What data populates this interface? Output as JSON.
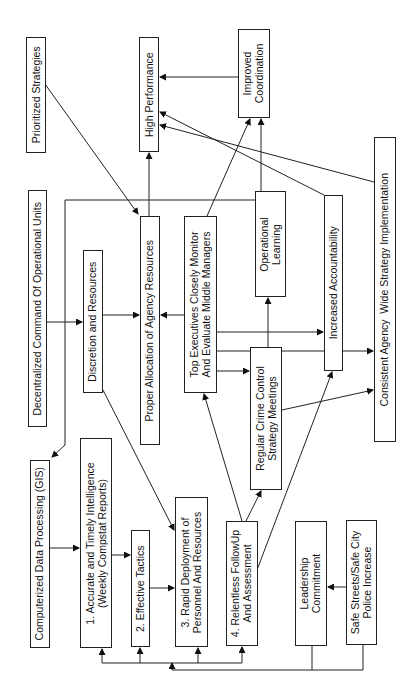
{
  "diagram": {
    "orientation": "rotated-90-ccw",
    "nodes": {
      "gis": {
        "label": "Computerized Data Processing (GIS)"
      },
      "decentralized": {
        "label": "Decentralized Command Of Operational Units"
      },
      "prioritized": {
        "label": "Prioritized Strategies"
      },
      "intelligence": {
        "label": "1. Accurate and Timely Intelligence\n(Weekly Compstat Reports)"
      },
      "discretion": {
        "label": "Discretion and Resources"
      },
      "tactics": {
        "label": "2. Effective Tactics"
      },
      "deployment": {
        "label": "3. Rapid Deployment of\nPersonnel And Resources"
      },
      "allocation": {
        "label": "Proper Allocation of Agency Resources"
      },
      "high_performance": {
        "label": "High Performance"
      },
      "top_executives": {
        "label": "Top Executives Closely Monitor\nAnd Evaluate Middle Managers"
      },
      "followup": {
        "label": "4. Relentless FollowUp\nAnd Assessment"
      },
      "meetings": {
        "label": "Regular Crime Control\nStrategy Meetings"
      },
      "learning": {
        "label": "Operational\nLearning"
      },
      "coordination": {
        "label": "Improved\nCoordination"
      },
      "accountability": {
        "label": "Increased Accountability"
      },
      "consistent": {
        "label": "Consistent Agency  Wide Strategy Implementation"
      },
      "leadership": {
        "label": "Leadership\nCommitment"
      },
      "safe_streets": {
        "label": "Safe Streets/Safe City\nPolice Increase"
      }
    },
    "edges": [
      {
        "from": "decentralized",
        "to": "gis"
      },
      {
        "from": "decentralized",
        "to": "discretion"
      },
      {
        "from": "prioritized",
        "to": "allocation"
      },
      {
        "from": "gis",
        "to": "intelligence"
      },
      {
        "from": "intelligence",
        "to": "tactics"
      },
      {
        "from": "tactics",
        "to": "deployment"
      },
      {
        "from": "discretion",
        "to": "allocation"
      },
      {
        "from": "discretion",
        "to": "deployment"
      },
      {
        "from": "allocation",
        "to": "high_performance"
      },
      {
        "from": "top_executives",
        "to": "allocation"
      },
      {
        "from": "top_executives",
        "to": "meetings"
      },
      {
        "from": "top_executives",
        "to": "coordination"
      },
      {
        "from": "top_executives",
        "to": "accountability"
      },
      {
        "from": "top_executives",
        "to": "consistent"
      },
      {
        "from": "followup",
        "to": "top_executives"
      },
      {
        "from": "followup",
        "to": "meetings"
      },
      {
        "from": "followup",
        "to": "accountability"
      },
      {
        "from": "meetings",
        "to": "learning"
      },
      {
        "from": "meetings",
        "to": "consistent"
      },
      {
        "from": "learning",
        "to": "coordination"
      },
      {
        "from": "learning",
        "to": "high_performance"
      },
      {
        "from": "coordination",
        "to": "high_performance"
      },
      {
        "from": "accountability",
        "to": "high_performance"
      },
      {
        "from": "consistent",
        "to": "high_performance"
      },
      {
        "from": "safe_streets",
        "to": "leadership"
      },
      {
        "from": "leadership",
        "to": "intelligence"
      },
      {
        "from": "leadership",
        "to": "tactics"
      },
      {
        "from": "leadership",
        "to": "deployment"
      },
      {
        "from": "leadership",
        "to": "followup"
      }
    ]
  }
}
